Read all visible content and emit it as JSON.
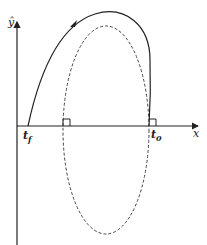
{
  "diagram": {
    "type": "trajectory-phase-plot",
    "axes": {
      "x_label": "x",
      "y_label": "ŷ"
    },
    "labels": {
      "t_final_main": "t",
      "t_final_sub": "f",
      "t_initial_main": "t",
      "t_initial_sub": "0"
    },
    "curves": [
      {
        "name": "trajectory",
        "style": "solid",
        "direction_arrow": true
      },
      {
        "name": "ellipse",
        "style": "dashed"
      }
    ],
    "right_angle_markers": 2,
    "colors": {
      "stroke": "#222222",
      "dashed": "#444444",
      "background": "#ffffff"
    }
  }
}
